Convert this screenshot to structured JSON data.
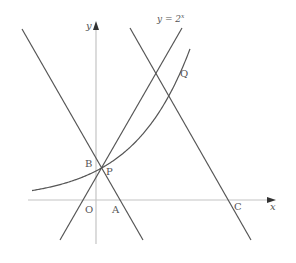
{
  "diagram": {
    "curve_label": {
      "base": "y = 2",
      "exponent": "x"
    },
    "axes": {
      "x_label": "x",
      "y_label": "y"
    },
    "points": {
      "origin": "O",
      "A": "A",
      "B": "B",
      "C": "C",
      "P": "P",
      "Q": "Q"
    },
    "elements": [
      "exponential curve y = 2^x",
      "line through B and A",
      "line through P and Q",
      "line through Q and C"
    ],
    "colors": {
      "lines": "#555555",
      "axes": "#c4c4c4",
      "background": "#ffffff"
    }
  }
}
